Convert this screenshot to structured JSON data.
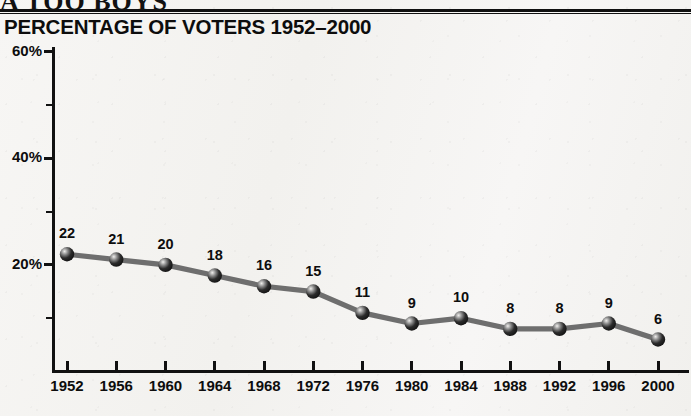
{
  "masthead": {
    "text": "A TOO BOYS"
  },
  "chart_title": "PERCENTAGE OF VOTERS 1952–2000",
  "axes": {
    "y_labels": [
      "60%",
      "40%",
      "20%"
    ],
    "y_minor_ticks": [
      50,
      30,
      10
    ],
    "y_major_ticks": [
      60,
      40,
      20
    ]
  },
  "chart_data": {
    "type": "line",
    "title": "PERCENTAGE OF VOTERS 1952–2000",
    "xlabel": "",
    "ylabel": "",
    "ylim": [
      0,
      60
    ],
    "ytick_values": [
      20,
      40,
      60
    ],
    "ytick_labels": [
      "20%",
      "40%",
      "60%"
    ],
    "yminor_tick_values": [
      10,
      30,
      50
    ],
    "grid": false,
    "legend": "none",
    "categories": [
      "1952",
      "1956",
      "1960",
      "1964",
      "1968",
      "1972",
      "1976",
      "1980",
      "1984",
      "1988",
      "1992",
      "1996",
      "2000"
    ],
    "values": [
      22,
      21,
      20,
      18,
      16,
      15,
      11,
      9,
      10,
      8,
      8,
      9,
      6
    ],
    "point_labels": [
      "22",
      "21",
      "20",
      "18",
      "16",
      "15",
      "11",
      "9",
      "10",
      "8",
      "8",
      "9",
      "6"
    ],
    "series": [
      {
        "name": "Percentage of voters",
        "values": [
          22,
          21,
          20,
          18,
          16,
          15,
          11,
          9,
          10,
          8,
          8,
          9,
          6
        ]
      }
    ]
  },
  "colors": {
    "line": "#6e6e6e",
    "marker": "#1a1a1a",
    "axis": "#111111",
    "text": "#0d0d0d",
    "background": "#f6f5f3"
  }
}
